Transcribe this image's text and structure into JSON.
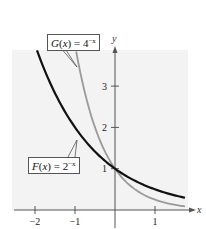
{
  "chart_data": {
    "type": "line",
    "title": "",
    "xlabel": "x",
    "ylabel": "y",
    "xlim": [
      -2.1,
      1.85
    ],
    "ylim": [
      0,
      3.9
    ],
    "x_ticks": [
      -2,
      -1,
      1
    ],
    "x_tick_labels": [
      "−2",
      "−1",
      "1"
    ],
    "y_ticks": [
      1,
      2,
      3
    ],
    "y_tick_labels": [
      "1",
      "2",
      "3"
    ],
    "grid": false,
    "legend": "callout labels",
    "series": [
      {
        "name": "F(x) = 2^-x",
        "label_fn": "F",
        "label_base": "2",
        "color": "#111111",
        "x": [
          -1.95,
          -1.5,
          -1,
          -0.5,
          0,
          0.5,
          1,
          1.5,
          1.75
        ],
        "values": [
          3.86,
          2.83,
          2.0,
          1.41,
          1.0,
          0.71,
          0.5,
          0.35,
          0.3
        ]
      },
      {
        "name": "G(x) = 4^-x",
        "label_fn": "G",
        "label_base": "4",
        "color": "#9a9a9a",
        "x": [
          -0.97,
          -0.75,
          -0.5,
          -0.25,
          0,
          0.5,
          1,
          1.5,
          1.75
        ],
        "values": [
          3.83,
          2.83,
          2.0,
          1.41,
          1.0,
          0.5,
          0.25,
          0.125,
          0.09
        ]
      }
    ],
    "annotations": [
      {
        "text": "G(x) = 4^-x",
        "points_to": [
          -0.95,
          3.6
        ]
      },
      {
        "text": "F(x) = 2^-x",
        "points_to": [
          -0.95,
          1.9
        ]
      }
    ]
  },
  "labels": {
    "x_axis": "x",
    "y_axis": "y",
    "g_label": {
      "fn": "G",
      "arg": "x",
      "base": "4",
      "exp": "−x"
    },
    "f_label": {
      "fn": "F",
      "arg": "x",
      "base": "2",
      "exp": "−x"
    }
  }
}
